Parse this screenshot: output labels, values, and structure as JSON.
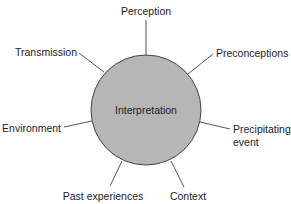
{
  "diagram": {
    "type": "hub-and-spoke",
    "center": {
      "label": "Interpretation",
      "fill": "#b6b6b6"
    },
    "factors": [
      {
        "id": "perception",
        "label": "Perception"
      },
      {
        "id": "preconceptions",
        "label": "Preconceptions"
      },
      {
        "id": "precipitating-event",
        "label_line1": "Precipitating",
        "label_line2": "event"
      },
      {
        "id": "context",
        "label": "Context"
      },
      {
        "id": "past-experiences",
        "label": "Past experiences"
      },
      {
        "id": "environment",
        "label": "Environment"
      },
      {
        "id": "transmission",
        "label": "Transmission"
      }
    ]
  }
}
